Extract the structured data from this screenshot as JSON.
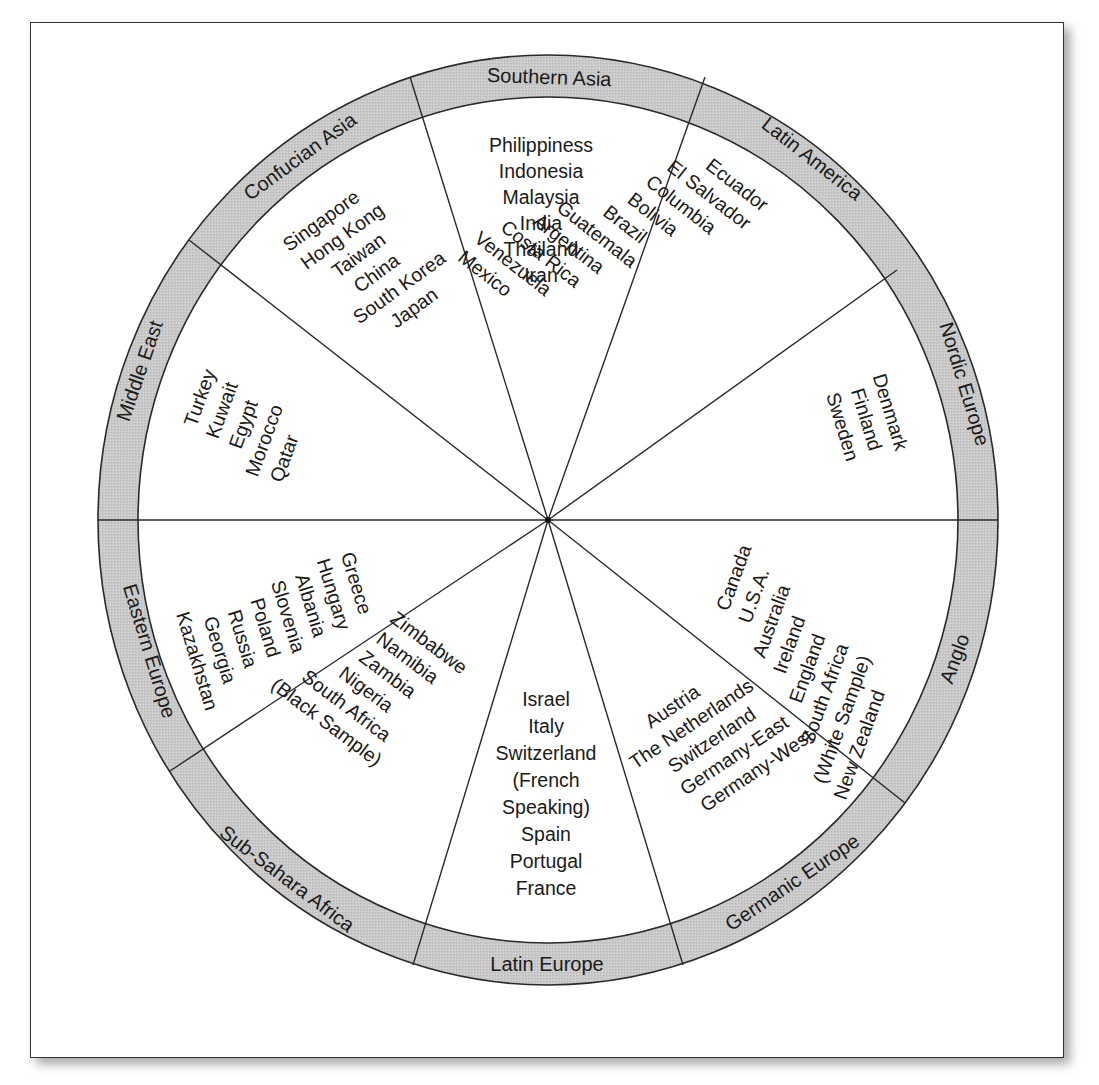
{
  "figure": {
    "title": "",
    "colors": {
      "ring_fill": "#c8c8c8",
      "line": "#2a2a2a",
      "background": "#ffffff"
    },
    "clusters": [
      {
        "name": "Southern Asia",
        "countries": [
          "Philippiness",
          "Indonesia",
          "Malaysia",
          "India",
          "Thailand",
          "Iran"
        ]
      },
      {
        "name": "Latin America",
        "countries": [
          "Ecuador",
          "El Salvador",
          "Columbia",
          "Bolivia",
          "Brazil",
          "Guatemala",
          "Argentina",
          "Costa Rica",
          "Venezuela",
          "Mexico"
        ]
      },
      {
        "name": "Nordic Europe",
        "countries": [
          "Denmark",
          "Finland",
          "Sweden"
        ]
      },
      {
        "name": "Anglo",
        "countries": [
          "Canada",
          "U.S.A.",
          "Australia",
          "Ireland",
          "England",
          "South Africa",
          "(White Sample)",
          "New Zealand"
        ]
      },
      {
        "name": "Germanic Europe",
        "countries": [
          "Austria",
          "The Netherlands",
          "Switzerland",
          "Germany-East",
          "Germany-West"
        ]
      },
      {
        "name": "Latin Europe",
        "countries": [
          "Israel",
          "Italy",
          "Switzerland",
          "(French",
          "Speaking)",
          "Spain",
          "Portugal",
          "France"
        ]
      },
      {
        "name": "Sub-Sahara Africa",
        "countries": [
          "Zimbabwe",
          "Namibia",
          "Zambia",
          "Nigeria",
          "South Africa",
          "(Black Sample)"
        ]
      },
      {
        "name": "Eastern Europe",
        "countries": [
          "Greece",
          "Hungary",
          "Albania",
          "Slovenia",
          "Poland",
          "Russia",
          "Georgia",
          "Kazakhstan"
        ]
      },
      {
        "name": "Middle East",
        "countries": [
          "Turkey",
          "Kuwait",
          "Egypt",
          "Morocco",
          "Qatar"
        ]
      },
      {
        "name": "Confucian Asia",
        "countries": [
          "Singapore",
          "Hong Kong",
          "Taiwan",
          "China",
          "South Korea",
          "Japan"
        ]
      }
    ]
  }
}
